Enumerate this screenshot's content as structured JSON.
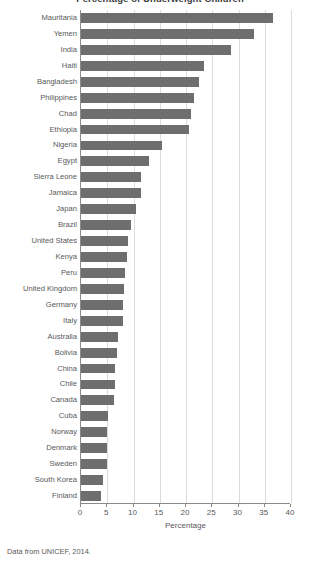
{
  "caption": "Data from UNICEF, 2014.",
  "chart_data": {
    "type": "bar",
    "orientation": "horizontal",
    "title": "Percentage of Underweight Children",
    "xlabel": "Percentage",
    "ylabel": "",
    "xlim": [
      0,
      40
    ],
    "xticks": [
      0,
      5,
      10,
      15,
      20,
      25,
      30,
      35,
      40
    ],
    "xtick_labels": [
      "0",
      "5",
      "10",
      "15",
      "20",
      "25",
      "30",
      "35",
      "40"
    ],
    "grid": "vertical",
    "legend": "none",
    "bar_color": "#6e6e6e",
    "categories": [
      "Mauritania",
      "Yemen",
      "India",
      "Haiti",
      "Bangladesh",
      "Philippines",
      "Chad",
      "Ethiopia",
      "Nigeria",
      "Egypt",
      "Sierra Leone",
      "Jamaica",
      "Japan",
      "Brazil",
      "United States",
      "Kenya",
      "Peru",
      "United Kingdom",
      "Germany",
      "Italy",
      "Australia",
      "Bolivia",
      "China",
      "Chile",
      "Canada",
      "Cuba",
      "Norway",
      "Denmark",
      "Sweden",
      "South Korea",
      "Finland"
    ],
    "values": [
      36.5,
      33.0,
      28.5,
      23.5,
      22.5,
      21.5,
      21.0,
      20.5,
      15.5,
      13.0,
      11.5,
      11.5,
      10.5,
      9.5,
      9.0,
      8.8,
      8.3,
      8.2,
      8.0,
      8.0,
      7.0,
      6.8,
      6.5,
      6.5,
      6.3,
      5.2,
      5.0,
      5.0,
      5.0,
      4.2,
      3.8
    ]
  }
}
